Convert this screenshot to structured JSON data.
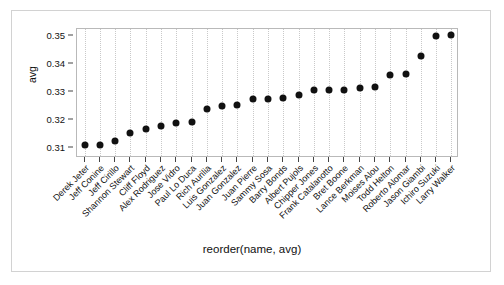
{
  "chart_data": {
    "type": "scatter",
    "title": "",
    "xlabel": "reorder(name, avg)",
    "ylabel": "avg",
    "ylim": [
      0.3065,
      0.3525
    ],
    "yticks": [
      0.31,
      0.32,
      0.33,
      0.34,
      0.35
    ],
    "ytick_labels": [
      "0.31",
      "0.32",
      "0.33",
      "0.34",
      "0.35"
    ],
    "grid": "vertical-dotted",
    "legend": "none",
    "categories": [
      "Derek Jeter",
      "Jeff Conine",
      "Jeff Cirillo",
      "Shannon Stewart",
      "Cliff Floyd",
      "Alex Rodriguez",
      "Jose Vidro",
      "Paul Lo Duca",
      "Rich Aurilia",
      "Luis Gonzalez",
      "Juan Gonzalez",
      "Juan Pierre",
      "Sammy Sosa",
      "Barry Bonds",
      "Albert Pujols",
      "Chipper Jones",
      "Frank Catalanotto",
      "Bret Boone",
      "Lance Berkman",
      "Moises Alou",
      "Todd Helton",
      "Roberto Alomar",
      "Jason Giambi",
      "Ichiro Suzuki",
      "Larry Walker"
    ],
    "values": [
      0.311,
      0.3111,
      0.3125,
      0.3155,
      0.317,
      0.318,
      0.319,
      0.3195,
      0.324,
      0.3252,
      0.3253,
      0.3275,
      0.3277,
      0.3279,
      0.3291,
      0.3307,
      0.3307,
      0.3309,
      0.3313,
      0.3318,
      0.3362,
      0.3363,
      0.343,
      0.3501,
      0.3505
    ],
    "marker": {
      "shape": "circle",
      "color": "#111111",
      "size": 7
    }
  },
  "axes": {
    "y_title": "avg",
    "x_title": "reorder(name, avg)"
  },
  "style": {
    "panel_border": "#b9b9b9",
    "outer_frame": "#d2d2d2",
    "grid_color": "#c9c9c9",
    "text_color": "#111111"
  }
}
